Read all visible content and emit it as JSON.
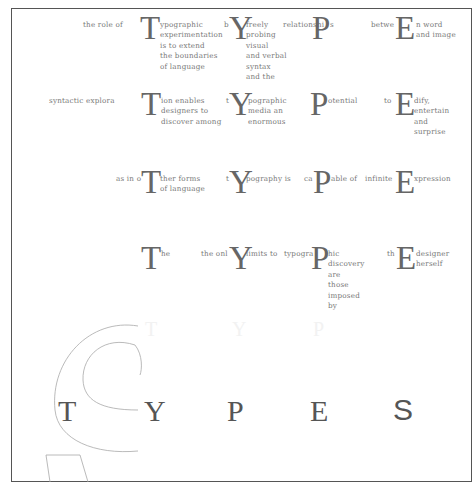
{
  "rows": [
    {
      "groups": [
        {
          "pre": "the role of",
          "cap": "T",
          "post": [
            "ypographic",
            "experimentation",
            "is to extend",
            "the boundaries",
            "of language"
          ]
        },
        {
          "pre": "b",
          "cap": "Y",
          "post": [
            "freely",
            "probing",
            "visual",
            "and verbal",
            "syntax",
            "and the"
          ]
        },
        {
          "pre": "relationshi",
          "cap": "P",
          "post": [
            "s"
          ]
        },
        {
          "pre": "betwe",
          "cap": "E",
          "post": [
            "n word",
            "and image"
          ]
        }
      ]
    },
    {
      "groups": [
        {
          "pre": "syntactic explora",
          "cap": "T",
          "post": [
            "ion enables",
            "designers to",
            "discover among"
          ]
        },
        {
          "pre": "t",
          "cap": "Y",
          "post": [
            "pographic",
            "media an",
            "enormous"
          ]
        },
        {
          "pre": "",
          "cap": "P",
          "post": [
            "otential"
          ]
        },
        {
          "pre": "to",
          "cap": "E",
          "post": [
            "dify,",
            "entertain",
            "and",
            "surprise"
          ]
        }
      ]
    },
    {
      "groups": [
        {
          "pre": "as in o",
          "cap": "T",
          "post": [
            "ther forms",
            "of language"
          ]
        },
        {
          "pre": "t",
          "cap": "Y",
          "post": [
            "pography is"
          ]
        },
        {
          "pre": "ca",
          "cap": "P",
          "post": [
            "able of"
          ]
        },
        {
          "pre": "infinite",
          "cap": "E",
          "post": [
            "xpression"
          ]
        }
      ]
    },
    {
      "groups": [
        {
          "pre": "",
          "cap": "T",
          "post": [
            "he"
          ]
        },
        {
          "pre": "the onl",
          "cap": "Y",
          "post": [
            "limits to"
          ]
        },
        {
          "pre": "typogra",
          "cap": "P",
          "post": [
            "hic",
            "discovery",
            "are",
            "those",
            "imposed",
            "by"
          ]
        },
        {
          "pre": "th",
          "cap": "E",
          "post": [
            "designer",
            "herself"
          ]
        }
      ]
    }
  ],
  "ghost_letters": [
    "T",
    "Y",
    "P"
  ],
  "title_letters": [
    "T",
    "Y",
    "P",
    "E",
    "S"
  ],
  "colors": {
    "frame": "#555555",
    "text": "#777777",
    "caps": "#666666",
    "outline": "#999999"
  }
}
